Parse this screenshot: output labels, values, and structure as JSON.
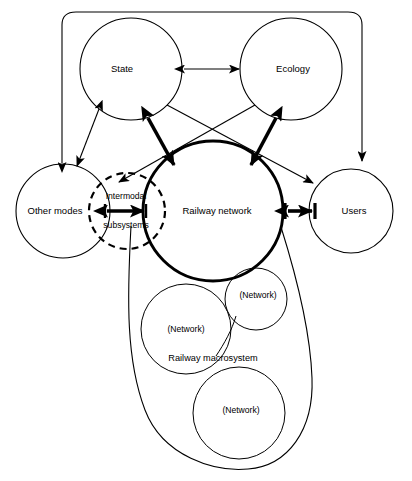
{
  "figure": {
    "background_color": "#ffffff",
    "line_color": "#000000",
    "width": 412,
    "height": 481
  },
  "nodes": {
    "state": {
      "label": "State",
      "cx": 131,
      "cy": 69,
      "r": 51,
      "style": "thin"
    },
    "ecology": {
      "label": "Ecology",
      "cx": 291,
      "cy": 69,
      "r": 51,
      "style": "thin"
    },
    "other_modes": {
      "label": "Other modes",
      "cx": 63,
      "cy": 211,
      "r": 47,
      "style": "thin"
    },
    "users": {
      "label": "Users",
      "cx": 351,
      "cy": 211,
      "r": 42,
      "style": "thin"
    },
    "railway_network": {
      "label": "Railway network",
      "cx": 213,
      "cy": 211,
      "r": 70,
      "style": "thick"
    },
    "intermodal": {
      "label_line1": "Intermodal",
      "label_line2": "subsystems",
      "cx": 127,
      "cy": 211,
      "r": 38,
      "style": "dashed"
    }
  },
  "macrosystem": {
    "label": "Railway macrosystem",
    "subnetworks": [
      {
        "label": "(Network)",
        "cx": 186,
        "cy": 329,
        "r": 45
      },
      {
        "label": "(Network)",
        "cx": 256,
        "cy": 299,
        "r": 31
      },
      {
        "label": "(Network)",
        "cx": 239,
        "cy": 413,
        "r": 46
      }
    ]
  },
  "edges": [
    {
      "id": "state-ecology",
      "from": "State",
      "to": "Ecology",
      "weight": "thin",
      "arrows": "double"
    },
    {
      "id": "state-railway",
      "from": "State",
      "to": "Railway network",
      "weight": "thick",
      "arrows": "double"
    },
    {
      "id": "ecology-railway",
      "from": "Ecology",
      "to": "Railway network",
      "weight": "thick",
      "arrows": "double"
    },
    {
      "id": "state-other-modes",
      "from": "State",
      "to": "Other modes",
      "weight": "thin",
      "arrows": "double"
    },
    {
      "id": "state-users",
      "from": "State",
      "to": "Users",
      "weight": "thin",
      "arrows": "single"
    },
    {
      "id": "ecology-intermodal",
      "from": "Ecology",
      "to": "Intermodal subsystems",
      "weight": "thin",
      "arrows": "single"
    },
    {
      "id": "railway-users",
      "from": "Railway network",
      "to": "Users",
      "weight": "thick",
      "arrows": "double-barred"
    },
    {
      "id": "intermodal-other-modes",
      "from": "Intermodal subsystems",
      "to": "Other modes",
      "weight": "thick",
      "arrows": "double-barred"
    },
    {
      "id": "bracket-other-modes",
      "from": "Macrosystem bracket",
      "to": "Other modes",
      "weight": "thin",
      "arrows": "single"
    },
    {
      "id": "bracket-users",
      "from": "Macrosystem bracket",
      "to": "Users",
      "weight": "thin",
      "arrows": "single"
    }
  ]
}
